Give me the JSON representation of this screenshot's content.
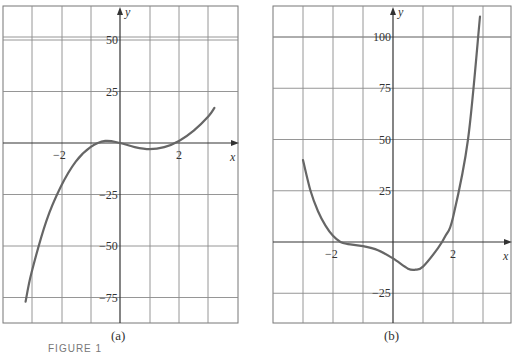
{
  "figure": {
    "label": "FIGURE 1"
  },
  "chart_data": [
    {
      "type": "line",
      "caption": "(a)",
      "xlabel": "x",
      "ylabel": "y",
      "xlim": [
        -4,
        4
      ],
      "ylim": [
        -90,
        65
      ],
      "grid": true,
      "x_tick_labels": [
        "-2",
        "2"
      ],
      "y_tick_labels": [
        "50",
        "25",
        "-25",
        "-50",
        "-75"
      ],
      "series": [
        {
          "name": "f(x)",
          "x": [
            -3.2,
            -3.0,
            -2.5,
            -2.0,
            -1.5,
            -1.0,
            -0.5,
            0.0,
            0.5,
            1.0,
            1.5,
            2.0,
            2.5,
            3.0,
            3.2
          ],
          "y": [
            -77,
            -63,
            -38,
            -21,
            -9,
            -2,
            1,
            0,
            -2,
            -3,
            -2,
            1,
            6,
            13,
            17
          ]
        }
      ]
    },
    {
      "type": "line",
      "caption": "(b)",
      "xlabel": "x",
      "ylabel": "y",
      "xlim": [
        -4,
        4
      ],
      "ylim": [
        -40,
        115
      ],
      "grid": true,
      "x_tick_labels": [
        "-2",
        "2"
      ],
      "y_tick_labels": [
        "100",
        "75",
        "50",
        "25",
        "-25"
      ],
      "series": [
        {
          "name": "g(x)",
          "x": [
            -3.0,
            -2.75,
            -2.5,
            -2.25,
            -2.0,
            -1.75,
            -1.5,
            -1.0,
            -0.5,
            0.0,
            0.5,
            0.75,
            1.0,
            1.5,
            1.75,
            2.0,
            2.5,
            2.9
          ],
          "y": [
            40,
            25,
            15,
            8,
            3,
            0,
            -1,
            -2,
            -4,
            -8,
            -13,
            -13.5,
            -12,
            -3,
            3,
            12,
            50,
            110
          ]
        }
      ]
    }
  ]
}
